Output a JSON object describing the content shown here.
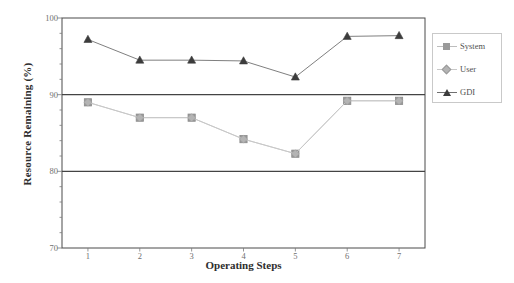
{
  "chart_data": {
    "type": "line",
    "title": "",
    "xlabel": "Operating Steps",
    "ylabel": "Resource Remaining (%)",
    "x": [
      1,
      2,
      3,
      4,
      5,
      6,
      7
    ],
    "categories": [
      "1",
      "2",
      "3",
      "4",
      "5",
      "6",
      "7"
    ],
    "xtick_labels": [
      "1",
      "2",
      "3",
      "4",
      "5",
      "6",
      "7"
    ],
    "ytick_labels": [
      "70",
      "80",
      "90",
      "100"
    ],
    "ytick_values": [
      70,
      80,
      90,
      100
    ],
    "xlim": [
      0.5,
      7.5
    ],
    "ylim": [
      70,
      100
    ],
    "grid": false,
    "legend_position": "right-outside",
    "series": [
      {
        "name": "System",
        "marker": "square",
        "color": "#9a9a9a",
        "line_color": "#bdbdbd",
        "values": [
          89.0,
          87.0,
          87.0,
          84.2,
          82.3,
          89.2,
          89.2
        ]
      },
      {
        "name": "User",
        "marker": "diamond",
        "color": "#b4b4b4",
        "line_color": "#c8c8c8",
        "values": [
          89.0,
          87.0,
          87.0,
          84.2,
          82.3,
          89.2,
          89.2
        ]
      },
      {
        "name": "GDI",
        "marker": "triangle",
        "color": "#3c3c3c",
        "line_color": "#707070",
        "values": [
          97.2,
          94.5,
          94.5,
          94.4,
          92.3,
          97.6,
          97.7
        ]
      }
    ],
    "axis_color": "#4a4a4a",
    "background_color": "#ffffff"
  },
  "legend": {
    "items": [
      {
        "label": "System",
        "marker": "square-marker",
        "color": "#9a9a9a"
      },
      {
        "label": "User",
        "marker": "diamond-marker",
        "color": "#b4b4b4"
      },
      {
        "label": "GDI",
        "marker": "triangle-marker",
        "color": "#3c3c3c"
      }
    ]
  }
}
